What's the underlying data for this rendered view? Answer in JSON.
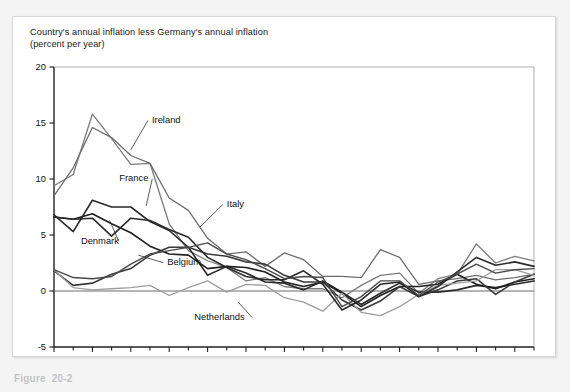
{
  "figure": {
    "axis_title_line1": "Country's annual inflation less Germany's annual inflation",
    "axis_title_line2": "(percent per year)",
    "caption": "Figure  20-2"
  },
  "chart_data": {
    "type": "line",
    "title": "Country's annual inflation less Germany's annual inflation (percent per year)",
    "xlabel": "",
    "ylabel": "percent per year",
    "xlim": [
      1978,
      2003
    ],
    "ylim": [
      -5,
      20
    ],
    "yticks": [
      -5,
      0,
      5,
      10,
      15,
      20
    ],
    "ytick_labels": [
      "-5",
      "0",
      "5",
      "10",
      "15",
      "20"
    ],
    "xticks": [
      1978,
      1980,
      1982,
      1984,
      1986,
      1988,
      1990,
      1992,
      1994,
      1996,
      1998,
      2000,
      2002
    ],
    "xtick_labels": [
      "1978",
      "1980",
      "1982",
      "1984",
      "1986",
      "1988",
      "1990",
      "1992",
      "1994",
      "1996",
      "1998",
      "2000",
      "2002"
    ],
    "x": [
      1978,
      1979,
      1980,
      1981,
      1982,
      1983,
      1984,
      1985,
      1986,
      1987,
      1988,
      1989,
      1990,
      1991,
      1992,
      1993,
      1994,
      1995,
      1996,
      1997,
      1998,
      1999,
      2000,
      2001,
      2002,
      2003
    ],
    "grid": false,
    "legend": "inline-labels",
    "zero_line": true,
    "series": [
      {
        "name": "Ireland",
        "color": "#7c7c7c",
        "width": 1.3,
        "label_x": 1983.1,
        "label_y": 15.0,
        "leader_to_x": 1982.0,
        "leader_to_y": 12.6,
        "values": [
          9.4,
          10.4,
          15.8,
          13.6,
          11.3,
          11.4,
          6.0,
          3.6,
          2.7,
          2.1,
          0.9,
          1.2,
          0.4,
          0.2,
          0.2,
          -0.6,
          0.5,
          1.4,
          1.6,
          -0.2,
          1.1,
          1.5,
          4.2,
          2.5,
          3.1,
          2.7
        ]
      },
      {
        "name": "Italy",
        "color": "#6e6e6e",
        "width": 1.3,
        "label_x": 1987.0,
        "label_y": 7.5,
        "leader_to_x": 1985.6,
        "leader_to_y": 5.7,
        "values": [
          8.5,
          11.0,
          14.6,
          13.7,
          12.1,
          11.4,
          8.3,
          7.2,
          4.7,
          3.3,
          3.5,
          2.2,
          3.4,
          2.8,
          1.3,
          1.3,
          1.2,
          3.7,
          3.0,
          0.6,
          0.9,
          1.1,
          1.4,
          1.0,
          1.2,
          1.5
        ]
      },
      {
        "name": "France",
        "color": "#2a2a2a",
        "width": 1.6,
        "label_x": 1981.4,
        "label_y": 9.8,
        "leader_to_x": 1982.8,
        "leader_to_y": 7.6,
        "values": [
          6.8,
          5.3,
          8.1,
          7.5,
          7.5,
          6.2,
          5.4,
          3.9,
          1.4,
          2.2,
          1.6,
          0.8,
          0.7,
          0.1,
          0.9,
          -0.1,
          -1.2,
          -0.2,
          0.7,
          -0.1,
          -0.1,
          0.1,
          0.5,
          0.3,
          0.6,
          0.9
        ]
      },
      {
        "name": "Denmark",
        "color": "#1f1f1f",
        "width": 1.6,
        "label_x": 1979.4,
        "label_y": 4.2,
        "leader_to_x": 1980.9,
        "leader_to_y": 6.3,
        "values": [
          6.6,
          6.4,
          6.9,
          6.0,
          5.2,
          4.0,
          3.3,
          3.2,
          2.0,
          2.2,
          2.1,
          1.7,
          0.8,
          0.4,
          0.8,
          -0.2,
          -1.4,
          -0.4,
          0.4,
          0.4,
          0.6,
          1.5,
          0.6,
          0.2,
          0.8,
          1.1
        ]
      },
      {
        "name": "Belgium",
        "color": "#3a3a3a",
        "width": 1.6,
        "label_x": 1983.9,
        "label_y": 2.3,
        "leader_to_x": 1982.4,
        "leader_to_y": 3.2,
        "values": [
          1.8,
          0.5,
          0.7,
          1.5,
          2.0,
          3.2,
          3.9,
          3.9,
          3.3,
          3.1,
          2.6,
          2.4,
          1.4,
          0.8,
          0.8,
          -0.8,
          -1.7,
          -0.9,
          0.4,
          -0.5,
          0.1,
          0.9,
          1.1,
          -0.3,
          0.8,
          1.5
        ]
      },
      {
        "name": "Netherlands",
        "color": "#9e9e9e",
        "width": 1.3,
        "label_x": 1985.3,
        "label_y": -2.6,
        "leader_to_x": 1987.6,
        "leader_to_y": -1.0,
        "values": [
          1.9,
          0.3,
          0.1,
          0.2,
          0.3,
          0.5,
          -0.4,
          0.3,
          0.9,
          -0.1,
          0.6,
          0.5,
          -0.6,
          -1.0,
          -1.8,
          -0.2,
          -1.9,
          -2.2,
          -1.4,
          -0.3,
          0.5,
          0.7,
          0.9,
          1.9,
          1.9,
          1.4
        ]
      },
      {
        "name": "unlabeled-dark",
        "color": "#2b2b2b",
        "width": 1.6,
        "label_x": null,
        "label_y": null,
        "leader_to_x": null,
        "leader_to_y": null,
        "values": [
          6.6,
          6.4,
          6.5,
          4.9,
          6.5,
          6.3,
          5.5,
          4.8,
          3.0,
          2.1,
          1.3,
          1.0,
          1.0,
          1.8,
          0.6,
          -1.7,
          -0.8,
          0.6,
          0.8,
          -0.5,
          0.4,
          1.7,
          3.0,
          2.3,
          2.6,
          2.2
        ]
      },
      {
        "name": "unlabeled-mid",
        "color": "#4a4a4a",
        "width": 1.4,
        "label_x": null,
        "label_y": null,
        "leader_to_x": null,
        "leader_to_y": null,
        "values": [
          1.9,
          1.2,
          1.1,
          1.3,
          2.4,
          3.3,
          3.6,
          3.9,
          4.3,
          3.3,
          2.8,
          2.0,
          1.1,
          1.3,
          1.2,
          -1.4,
          -0.5,
          0.9,
          0.9,
          -0.4,
          0.8,
          1.5,
          2.4,
          1.6,
          1.9,
          2.0
        ]
      }
    ]
  }
}
